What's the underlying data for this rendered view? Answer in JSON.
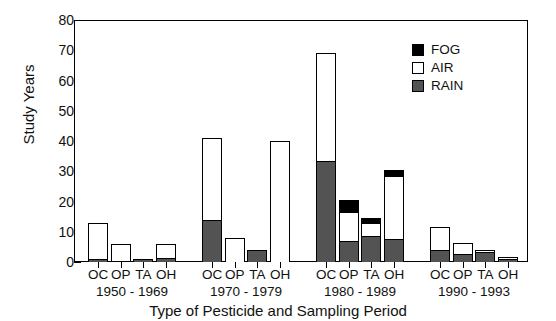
{
  "chart_data": {
    "type": "bar",
    "subtype": "stacked",
    "title": "",
    "xlabel": "Type of Pesticide and Sampling Period",
    "ylabel": "Study Years",
    "ylim": [
      0,
      80
    ],
    "ytick_labels": [
      "0",
      "10",
      "20",
      "30",
      "40",
      "50",
      "60",
      "70",
      "80"
    ],
    "ytick_values": [
      0,
      10,
      20,
      30,
      40,
      50,
      60,
      70,
      80
    ],
    "yminor_step": 5,
    "grid": false,
    "legend_position": "top-right",
    "series": [
      {
        "name": "FOG",
        "color": "#000000"
      },
      {
        "name": "AIR",
        "color": "#ffffff"
      },
      {
        "name": "RAIN",
        "color": "#535353"
      }
    ],
    "group_label_rows": [
      "OC",
      "OP",
      "TA",
      "OH"
    ],
    "groups": [
      {
        "period": "1950 - 1969",
        "bars": [
          {
            "category": "OC",
            "rain": 1.0,
            "air": 12.0,
            "fog": 0.0,
            "total": 13.0
          },
          {
            "category": "OP",
            "rain": 0.5,
            "air": 5.5,
            "fog": 0.0,
            "total": 6.0
          },
          {
            "category": "TA",
            "rain": 1.0,
            "air": 0.0,
            "fog": 0.0,
            "total": 1.0
          },
          {
            "category": "OH",
            "rain": 1.2,
            "air": 4.8,
            "fog": 0.0,
            "total": 6.0
          }
        ]
      },
      {
        "period": "1970 - 1979",
        "bars": [
          {
            "category": "OC",
            "rain": 14.0,
            "air": 27.0,
            "fog": 0.0,
            "total": 41.0
          },
          {
            "category": "OP",
            "rain": 0.0,
            "air": 8.0,
            "fog": 0.0,
            "total": 8.0
          },
          {
            "category": "TA",
            "rain": 4.0,
            "air": 0.0,
            "fog": 0.0,
            "total": 4.0
          },
          {
            "category": "OH",
            "rain": 0.0,
            "air": 40.0,
            "fog": 0.0,
            "total": 40.0
          }
        ]
      },
      {
        "period": "1980 - 1989",
        "bars": [
          {
            "category": "OC",
            "rain": 33.5,
            "air": 35.5,
            "fog": 0.0,
            "total": 69.0
          },
          {
            "category": "OP",
            "rain": 6.8,
            "air": 9.7,
            "fog": 4.0,
            "total": 20.5
          },
          {
            "category": "TA",
            "rain": 8.5,
            "air": 4.5,
            "fog": 1.5,
            "total": 14.5
          },
          {
            "category": "OH",
            "rain": 7.5,
            "air": 21.0,
            "fog": 2.0,
            "total": 30.5
          }
        ]
      },
      {
        "period": "1990 - 1993",
        "bars": [
          {
            "category": "OC",
            "rain": 4.0,
            "air": 7.5,
            "fog": 0.0,
            "total": 11.5
          },
          {
            "category": "OP",
            "rain": 2.7,
            "air": 3.6,
            "fog": 0.0,
            "total": 6.3
          },
          {
            "category": "TA",
            "rain": 3.3,
            "air": 0.7,
            "fog": 0.0,
            "total": 4.0
          },
          {
            "category": "OH",
            "rain": 1.0,
            "air": 0.7,
            "fog": 0.0,
            "total": 1.7
          }
        ]
      }
    ]
  }
}
